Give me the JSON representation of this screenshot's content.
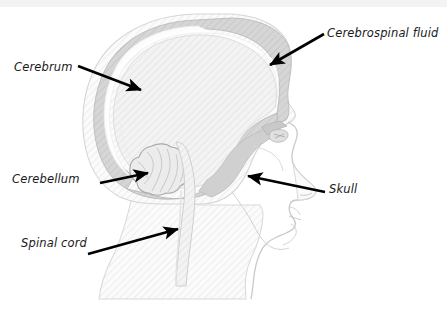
{
  "figure": {
    "background_color": "#ffffff",
    "top_strip_color": "#f3f3f3"
  },
  "labels": [
    {
      "id": "cerebrum",
      "text": "Cerebrum",
      "x": 14,
      "y": 60
    },
    {
      "id": "cerebrospinal_fluid",
      "text": "Cerebrospinal fluid",
      "x": 327,
      "y": 26
    },
    {
      "id": "cerebellum",
      "text": "Cerebellum",
      "x": 12,
      "y": 172
    },
    {
      "id": "skull",
      "text": "Skull",
      "x": 329,
      "y": 182
    },
    {
      "id": "spinal_cord",
      "text": "Spinal cord",
      "x": 21,
      "y": 236
    }
  ],
  "leader_lines": [
    {
      "id": "cerebrum-arrow",
      "from": [
        78,
        66
      ],
      "to": [
        143,
        91
      ],
      "color": "#000000"
    },
    {
      "id": "csf-arrow",
      "from": [
        324,
        34
      ],
      "to": [
        268,
        66
      ],
      "color": "#000000"
    },
    {
      "id": "cerebellum-arrow",
      "from": [
        103,
        182
      ],
      "to": [
        150,
        172
      ],
      "color": "#000000"
    },
    {
      "id": "skull-arrow",
      "from": [
        325,
        192
      ],
      "to": [
        246,
        175
      ],
      "color": "#000000"
    },
    {
      "id": "spinalcord-arrow",
      "from": [
        90,
        253
      ],
      "to": [
        180,
        228
      ],
      "color": "#000000"
    }
  ],
  "anatomy_parts": [
    {
      "id": "scalp",
      "label": "Scalp / outer soft tissue",
      "fill": "#f2f2f2",
      "stroke": "#d8d8d8"
    },
    {
      "id": "skull-bone",
      "label": "Skull bone",
      "fill": "#d2d2d2",
      "stroke": "#bcbcbc"
    },
    {
      "id": "cerebrospinal-fluid",
      "label": "Cerebrospinal fluid",
      "fill": "#ffffff",
      "stroke": "#e4e4e4"
    },
    {
      "id": "cerebrum",
      "label": "Cerebrum",
      "fill": "#f5f5f5",
      "stroke": "#dcdcdc"
    },
    {
      "id": "cerebellum",
      "label": "Cerebellum",
      "fill": "#ececec",
      "stroke": "#a8a8a8"
    },
    {
      "id": "brainstem",
      "label": "Brainstem",
      "fill": "#efefef",
      "stroke": "#cfcfcf"
    },
    {
      "id": "spinal-cord",
      "label": "Spinal cord",
      "fill": "#f0f0f0",
      "stroke": "#cccccc"
    },
    {
      "id": "face-profile",
      "label": "Face profile",
      "fill": "#fafafa",
      "stroke": "#d0d0d0"
    },
    {
      "id": "neck",
      "label": "Neck",
      "fill": "#f4f4f4",
      "stroke": "#d4d4d4"
    }
  ],
  "colors": {
    "line": "#000000",
    "text": "#1a1a1a",
    "bone_gray": "#d2d2d2",
    "tissue_gray": "#f2f2f2",
    "hatch_gray": "#e9e9e9"
  }
}
